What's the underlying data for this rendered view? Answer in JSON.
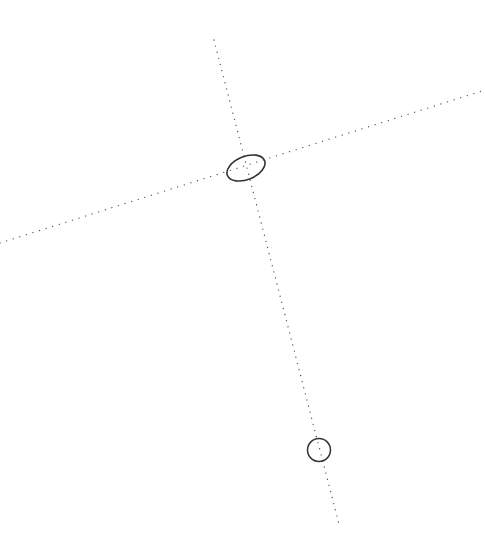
{
  "diagram": {
    "background": "#ffffff",
    "stroke_color": "#333333",
    "dot_color": "#555555",
    "lines": [
      {
        "name": "axis-line-steep",
        "x1": 214,
        "y1": 40,
        "x2": 339,
        "y2": 524,
        "style": "dotted"
      },
      {
        "name": "axis-line-shallow",
        "x1": 0,
        "y1": 243,
        "x2": 482,
        "y2": 91,
        "style": "dotted"
      }
    ],
    "ellipse": {
      "cx": 246,
      "cy": 168,
      "rx": 20,
      "ry": 11.5,
      "rotation": -22
    },
    "circle": {
      "cx": 319,
      "cy": 450,
      "r": 11.5
    }
  }
}
